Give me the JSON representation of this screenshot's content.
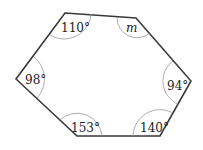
{
  "diagram": {
    "shape": "hexagon",
    "vertices": [
      {
        "id": "top-left",
        "x": 65,
        "y": 13,
        "angle": "110°"
      },
      {
        "id": "top-right",
        "x": 136,
        "y": 18,
        "angle": "m"
      },
      {
        "id": "right",
        "x": 191,
        "y": 81,
        "angle": "94°"
      },
      {
        "id": "bottom-right",
        "x": 160,
        "y": 136,
        "angle": "140°"
      },
      {
        "id": "bottom-left",
        "x": 77,
        "y": 136,
        "angle": "153°"
      },
      {
        "id": "left",
        "x": 16,
        "y": 79,
        "angle": "98°"
      }
    ],
    "labels": {
      "a1": "110°",
      "a2": "m",
      "a3": "94°",
      "a4": "140°",
      "a5": "153°",
      "a6": "98°"
    },
    "colors": {
      "edge": "#3a3a3a",
      "arc": "#8a8a8a",
      "text": "#222222"
    }
  }
}
